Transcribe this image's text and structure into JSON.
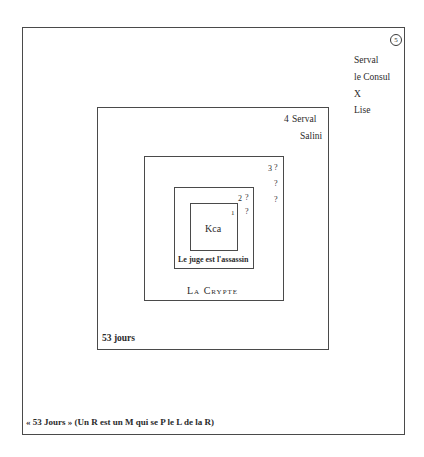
{
  "diagram": {
    "type": "nested-boxes",
    "colors": {
      "background": "#ffffff",
      "lines": "#4a4a4a",
      "text": "#2b2b2b"
    },
    "levels": {
      "level5": {
        "number": "5",
        "characters": [
          "Serval",
          "le Consul",
          "X",
          "Lise"
        ],
        "caption": "« 53 Jours » (Un R est un M qui se P le L de la R)"
      },
      "level4": {
        "number": "4",
        "characters": [
          "Serval",
          "Salini"
        ],
        "caption": "53 jours"
      },
      "level3": {
        "number": "3",
        "characters": [
          "?",
          "?",
          "?"
        ],
        "caption": "La Crypte"
      },
      "level2": {
        "number": "2",
        "characters": [
          "?"
        ],
        "caption": "Le juge est l'assassin"
      },
      "level1": {
        "number": "1",
        "characters": [
          "?"
        ],
        "caption": "Kca"
      }
    }
  }
}
